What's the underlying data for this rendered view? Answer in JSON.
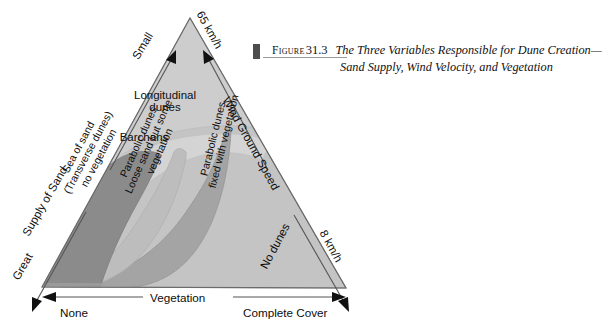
{
  "caption": {
    "bar_color": "#4d4d4d",
    "label": "Figure",
    "number": "31.3",
    "title_line1": "The Three Variables Responsible for Dune Creation—",
    "title_line2": "Sand Supply, Wind Velocity, and Vegetation"
  },
  "diagram": {
    "type": "ternary-diagram",
    "title": "The Three Variables Responsible for Dune Creation",
    "axes": [
      {
        "id": "supply-of-sand",
        "name": "Supply of Sand",
        "position": "left",
        "low_end_label": "Small",
        "high_end_label": "Great",
        "arrow_low": "up",
        "arrow_high": "down"
      },
      {
        "id": "wind-ground-speed",
        "name": "Wind Ground Speed",
        "position": "right",
        "low_end_label": "8 km/h",
        "high_end_label": "65 km/h",
        "arrow_low": "down",
        "arrow_high": "up"
      },
      {
        "id": "vegetation",
        "name": "Vegetation",
        "position": "bottom",
        "low_end_label": "None",
        "high_end_label": "Complete Cover",
        "arrow_low": "left",
        "arrow_high": "right"
      }
    ],
    "regions": [
      {
        "id": "longitudinal-dunes",
        "label_line1": "Longitudinal",
        "label_line2": "dunes",
        "fill": "#cdcdcd"
      },
      {
        "id": "barchans",
        "label_line1": "Barchans",
        "label_line2": "",
        "fill": "#d4d4d4"
      },
      {
        "id": "sea-of-sand",
        "label_line1": "Sea of sand",
        "label_line2": "(Transverse dunes)",
        "label_line3": "no vegetation",
        "fill": "#8b8b8b"
      },
      {
        "id": "parabolic-dunes-loose",
        "label_line1": "Parabolic dunes",
        "label_line2": "Loose sand but some",
        "label_line3": "vegetation",
        "fill": "#bdbdbd"
      },
      {
        "id": "parabolic-dunes-fixed",
        "label_line1": "Parabolic dunes",
        "label_line2": "fixed with vegetation",
        "fill": "#a4a4a4"
      },
      {
        "id": "no-dunes",
        "label_line1": "No dunes",
        "label_line2": "",
        "fill": "#c4c4c4"
      }
    ],
    "colors": {
      "outline": "#555555",
      "arrow": "#111111",
      "background": "#ffffff"
    }
  }
}
